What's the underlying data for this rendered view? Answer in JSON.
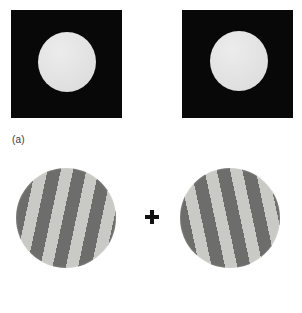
{
  "figure": {
    "background_color": "#ffffff",
    "width": 302,
    "height": 313
  },
  "panels": [
    {
      "id": "a",
      "caption": "(a)",
      "description": "Pair of identical stimuli: light disk on black square background",
      "stimuli": [
        {
          "name": "left-eye-stimulus",
          "shape": "square",
          "background_color": "#080808",
          "inner_shape": "circle",
          "inner_color": "#e3e3e3"
        },
        {
          "name": "right-eye-stimulus",
          "shape": "square",
          "background_color": "#080808",
          "inner_shape": "circle",
          "inner_color": "#e3e3e3"
        }
      ]
    },
    {
      "id": "b",
      "caption": "(b)",
      "description": "Pair of orthogonally oriented square-wave gratings within circular apertures",
      "fixation_mark": "+",
      "stimuli": [
        {
          "name": "left-eye-grating",
          "shape": "circle",
          "pattern": "square-wave-grating",
          "orientation_deg": 12,
          "orientation_label": "clockwise",
          "light_bar_color": "#c9c9c6",
          "dark_bar_color": "#6d6d6b",
          "bar_count": 8
        },
        {
          "name": "right-eye-grating",
          "shape": "circle",
          "pattern": "square-wave-grating",
          "orientation_deg": -12,
          "orientation_label": "counter-clockwise",
          "light_bar_color": "#c9c9c6",
          "dark_bar_color": "#6d6d6b",
          "bar_count": 8
        }
      ]
    }
  ],
  "colors": {
    "square_background": "#080808",
    "disk_fill": "#e3e3e3",
    "grating_light": "#c9c9c6",
    "grating_dark": "#6d6d6b",
    "caption_text": "#3a3a3a",
    "fixation": "#111111"
  }
}
